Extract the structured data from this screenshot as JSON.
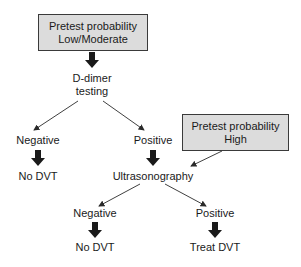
{
  "boxes": {
    "low_moderate": {
      "line1": "Pretest probability",
      "line2": "Low/Moderate"
    },
    "high": {
      "line1": "Pretest probability",
      "line2": "High"
    }
  },
  "nodes": {
    "d_dimer_line1": "D-dimer",
    "d_dimer_line2": "testing",
    "ddimer_negative": "Negative",
    "ddimer_negative_result": "No DVT",
    "ddimer_positive": "Positive",
    "ultrasonography": "Ultrasonography",
    "us_negative": "Negative",
    "us_negative_result": "No DVT",
    "us_positive": "Positive",
    "us_positive_result": "Treat DVT"
  },
  "colors": {
    "box_fill": "#dcdcdc",
    "ink": "#1a1a1a"
  }
}
